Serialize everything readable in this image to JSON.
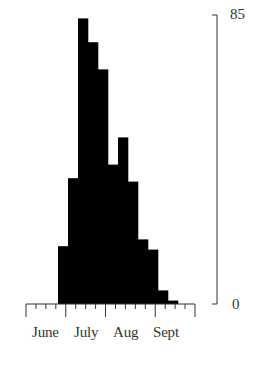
{
  "chart_data": {
    "type": "bar",
    "title": "",
    "xlabel": "",
    "ylabel": "",
    "bin_unit": "week",
    "categories": [
      "wk1",
      "wk2",
      "wk3",
      "wk4",
      "wk5",
      "wk6",
      "wk7",
      "wk8",
      "wk9",
      "wk10",
      "wk11",
      "wk12",
      "wk13",
      "wk14",
      "wk15",
      "wk16",
      "wk17"
    ],
    "values": [
      0,
      0,
      0,
      17,
      37,
      84,
      77,
      69,
      41,
      49,
      36,
      19,
      16,
      4,
      1,
      0,
      0
    ],
    "x_tick_labels": [
      "June",
      "July",
      "Aug",
      "Sept"
    ],
    "y_tick_labels": [
      "0",
      "85"
    ],
    "ylim": [
      0,
      85
    ],
    "y_axis_position": "right",
    "grid": false,
    "legend": null,
    "bar_color": "#000000"
  },
  "axis": {
    "x_labels": [
      "June",
      "July",
      "Aug",
      "Sept"
    ],
    "y_max_label": "85",
    "y_min_label": "0"
  }
}
